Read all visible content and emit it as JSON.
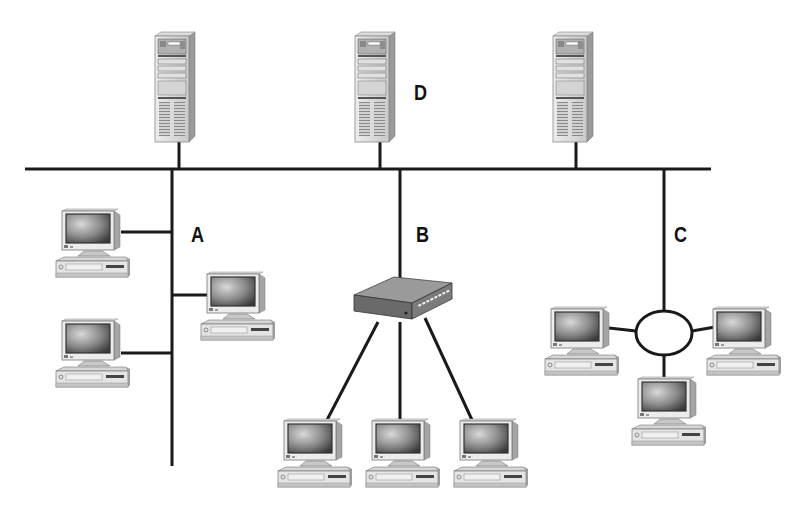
{
  "diagram": {
    "labels": {
      "A": "A",
      "B": "B",
      "C": "C",
      "D": "D"
    },
    "nodes": {
      "servers": [
        {
          "id": "server-1",
          "x": 155,
          "y": 32
        },
        {
          "id": "server-2",
          "x": 355,
          "y": 32,
          "label": "D"
        },
        {
          "id": "server-3",
          "x": 553,
          "y": 32
        }
      ],
      "segment_A_bus": {
        "label": "A",
        "topology": "bus",
        "computers": 3
      },
      "segment_B_star": {
        "label": "B",
        "topology": "star",
        "hub": 1,
        "computers": 3
      },
      "segment_C_ring": {
        "label": "C",
        "topology": "ring",
        "computers": 3
      }
    },
    "colors": {
      "line": "#1a1a1a",
      "device_light": "#e6e6e6",
      "device_mid": "#b8b8b8",
      "device_dark": "#555555",
      "screen": "#6e6e6e",
      "background": "#ffffff"
    }
  }
}
